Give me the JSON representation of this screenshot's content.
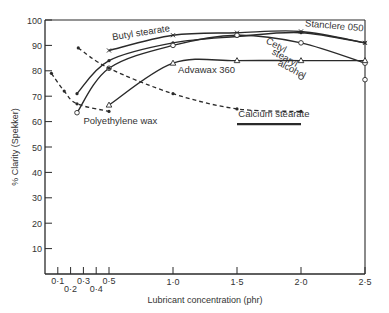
{
  "chart_data": {
    "type": "line",
    "title": "",
    "xlabel": "Lubricant concentration (phr)",
    "ylabel": "% Clarity (Spekker)",
    "xlim": [
      0,
      2.5
    ],
    "ylim": [
      0,
      100
    ],
    "grid": false,
    "legend": "inline labels",
    "x_ticks_minor": [
      {
        "v": 0.1,
        "label": "0·1",
        "row": 0
      },
      {
        "v": 0.2,
        "label": "0·2",
        "row": 1
      },
      {
        "v": 0.3,
        "label": "0·3",
        "row": 0
      },
      {
        "v": 0.4,
        "label": "0·4",
        "row": 1
      },
      {
        "v": 0.5,
        "label": "0·5",
        "row": 0
      }
    ],
    "x_ticks_major": [
      {
        "v": 1.0,
        "label": "1·0"
      },
      {
        "v": 1.5,
        "label": "1·5"
      },
      {
        "v": 2.0,
        "label": "2·0"
      },
      {
        "v": 2.5,
        "label": "2·5"
      }
    ],
    "y_ticks": [
      {
        "v": 10,
        "label": "10"
      },
      {
        "v": 20,
        "label": "20"
      },
      {
        "v": 30,
        "label": "30"
      },
      {
        "v": 40,
        "label": "40"
      },
      {
        "v": 50,
        "label": "50"
      },
      {
        "v": 60,
        "label": "60"
      },
      {
        "v": 70,
        "label": "70"
      },
      {
        "v": 80,
        "label": "80"
      },
      {
        "v": 90,
        "label": "90"
      },
      {
        "v": 100,
        "label": "100"
      }
    ],
    "series": [
      {
        "name": "Butyl stearate",
        "style": "solid",
        "marker": "cross",
        "points": [
          [
            0.5,
            88
          ],
          [
            1.0,
            94
          ],
          [
            1.5,
            95
          ],
          [
            2.0,
            95.5
          ],
          [
            2.5,
            91
          ]
        ],
        "label_pos": [
          0.53,
          92
        ],
        "label_angle": -9
      },
      {
        "name": "Stanclere 050",
        "style": "solid",
        "marker": "dot",
        "points": [
          [
            0.25,
            71
          ],
          [
            0.5,
            84
          ],
          [
            1.0,
            91
          ],
          [
            1.5,
            93.5
          ],
          [
            2.0,
            95
          ],
          [
            2.5,
            91
          ]
        ],
        "label_pos": [
          2.03,
          97.5
        ],
        "label_angle": 5
      },
      {
        "name": "Cetyl stearyl alcohol",
        "style": "solid",
        "marker": "circle",
        "points": [
          [
            0.25,
            63.5
          ],
          [
            0.5,
            81
          ],
          [
            1.0,
            90
          ],
          [
            1.5,
            94
          ],
          [
            2.0,
            91
          ],
          [
            2.5,
            83
          ]
        ],
        "label_lines": [
          "Cetyl",
          "stearyl",
          "alcohol"
        ],
        "label_pos": [
          1.72,
          91
        ],
        "label_angle": 28
      },
      {
        "name": "Advawax 360",
        "style": "solid",
        "marker": "triangle",
        "points": [
          [
            0.5,
            66.5
          ],
          [
            1.0,
            83
          ],
          [
            1.5,
            84
          ],
          [
            2.0,
            84
          ],
          [
            2.5,
            84
          ]
        ],
        "label_pos": [
          1.04,
          79
        ],
        "label_angle": 0
      },
      {
        "name": "Calcium stearate",
        "style": "dashed",
        "marker": "dot",
        "points": [
          [
            0.26,
            89
          ],
          [
            0.5,
            81
          ],
          [
            1.0,
            71
          ],
          [
            1.5,
            65
          ],
          [
            2.0,
            64
          ]
        ],
        "label_pos": [
          1.51,
          62
        ],
        "label_angle": 0
      },
      {
        "name": "Polyethylene wax",
        "style": "dashed",
        "marker": "dot",
        "points": [
          [
            0.05,
            79
          ],
          [
            0.15,
            72
          ],
          [
            0.25,
            67
          ],
          [
            0.5,
            64
          ]
        ],
        "label_pos": [
          0.3,
          59
        ],
        "label_angle": 0
      }
    ],
    "isolated_points": [
      {
        "x": 2.0,
        "y": 77.5,
        "marker": "circle"
      },
      {
        "x": 2.5,
        "y": 76.5,
        "marker": "circle"
      }
    ],
    "underline": {
      "x1": 1.5,
      "x2": 2.0,
      "y": 59
    }
  }
}
